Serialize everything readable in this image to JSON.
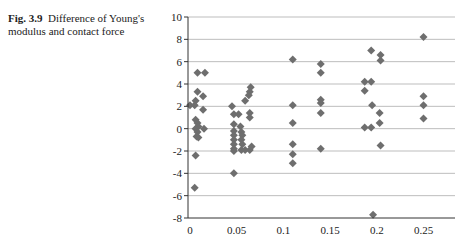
{
  "caption": {
    "label": "Fig. 3.9",
    "text": "Difference of Young's modulus and contact force"
  },
  "chart_data": {
    "type": "scatter",
    "title": "",
    "xlabel": "",
    "ylabel": "",
    "xlim": [
      0,
      0.28
    ],
    "ylim": [
      -8,
      10
    ],
    "xticks": [
      0,
      0.05,
      0.1,
      0.15,
      0.2,
      0.25
    ],
    "xtick_labels": [
      "0",
      "0.05",
      "0.1",
      "0.15",
      "0.2",
      "0.25"
    ],
    "yticks": [
      -8,
      -6,
      -4,
      -2,
      0,
      2,
      4,
      6,
      8,
      10
    ],
    "ytick_labels": [
      "-8",
      "-6",
      "-4",
      "-2",
      "0",
      "2",
      "4",
      "6",
      "8",
      "10"
    ],
    "grid": "horizontal",
    "legend": "none",
    "marker": "diamond",
    "marker_color": "#6e6e6e",
    "grid_color": "#bdbdbd",
    "series": [
      {
        "name": "Difference",
        "points": [
          [
            0.0,
            2.1
          ],
          [
            0.008,
            5.0
          ],
          [
            0.016,
            5.0
          ],
          [
            0.008,
            3.3
          ],
          [
            0.014,
            2.9
          ],
          [
            0.006,
            2.5
          ],
          [
            0.005,
            2.1
          ],
          [
            0.014,
            1.7
          ],
          [
            0.006,
            0.8
          ],
          [
            0.008,
            0.5
          ],
          [
            0.009,
            0.2
          ],
          [
            0.015,
            0.0
          ],
          [
            0.006,
            0.0
          ],
          [
            0.008,
            -0.3
          ],
          [
            0.007,
            -0.7
          ],
          [
            0.009,
            -0.8
          ],
          [
            0.006,
            -2.4
          ],
          [
            0.005,
            -5.3
          ],
          [
            0.065,
            3.7
          ],
          [
            0.064,
            3.3
          ],
          [
            0.063,
            3.0
          ],
          [
            0.059,
            2.5
          ],
          [
            0.045,
            2.0
          ],
          [
            0.047,
            1.3
          ],
          [
            0.052,
            1.3
          ],
          [
            0.064,
            1.4
          ],
          [
            0.064,
            1.0
          ],
          [
            0.047,
            0.4
          ],
          [
            0.054,
            0.2
          ],
          [
            0.047,
            -0.2
          ],
          [
            0.055,
            -0.3
          ],
          [
            0.047,
            -0.6
          ],
          [
            0.056,
            -0.6
          ],
          [
            0.047,
            -1.0
          ],
          [
            0.055,
            -1.0
          ],
          [
            0.047,
            -1.4
          ],
          [
            0.056,
            -1.4
          ],
          [
            0.047,
            -1.8
          ],
          [
            0.055,
            -1.9
          ],
          [
            0.059,
            -1.9
          ],
          [
            0.064,
            -1.9
          ],
          [
            0.047,
            -2.0
          ],
          [
            0.066,
            -1.6
          ],
          [
            0.047,
            -4.0
          ],
          [
            0.11,
            6.2
          ],
          [
            0.11,
            2.1
          ],
          [
            0.11,
            0.5
          ],
          [
            0.11,
            -1.4
          ],
          [
            0.11,
            -2.3
          ],
          [
            0.11,
            -3.1
          ],
          [
            0.14,
            5.8
          ],
          [
            0.14,
            5.0
          ],
          [
            0.14,
            2.6
          ],
          [
            0.14,
            2.3
          ],
          [
            0.14,
            1.4
          ],
          [
            0.14,
            -1.8
          ],
          [
            0.187,
            4.2
          ],
          [
            0.194,
            4.2
          ],
          [
            0.187,
            3.4
          ],
          [
            0.195,
            2.1
          ],
          [
            0.187,
            0.1
          ],
          [
            0.194,
            0.1
          ],
          [
            0.194,
            7.0
          ],
          [
            0.204,
            6.6
          ],
          [
            0.204,
            6.1
          ],
          [
            0.203,
            1.4
          ],
          [
            0.203,
            0.5
          ],
          [
            0.204,
            -1.5
          ],
          [
            0.196,
            -7.7
          ],
          [
            0.25,
            8.2
          ],
          [
            0.25,
            2.9
          ],
          [
            0.25,
            2.1
          ],
          [
            0.25,
            0.9
          ]
        ]
      }
    ]
  }
}
